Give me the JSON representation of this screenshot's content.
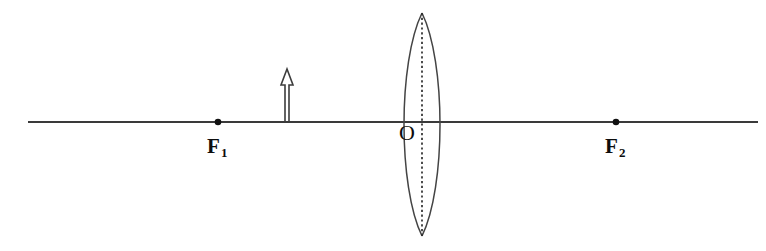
{
  "figure": {
    "background_color": "#ffffff",
    "line_color": "#3a3a3a",
    "label_color": "#0d0d0d",
    "width": 766,
    "height": 251
  },
  "optical_axis": {
    "name": "principal-axis",
    "x_start": 28,
    "x_end": 758,
    "y": 122
  },
  "lens": {
    "type": "biconvex-converging",
    "center_x": 422,
    "top_y": 13,
    "bottom_y": 236,
    "half_width": 24,
    "center_line_style": "dotted"
  },
  "object_arrow": {
    "name": "object",
    "base_x": 287,
    "base_y": 122,
    "tip_y": 69,
    "shaft_half_width": 2,
    "head_half_width": 6,
    "head_height": 16,
    "style": "hollow-outline"
  },
  "points": [
    {
      "id": "f1",
      "label": "F",
      "subscript": "1",
      "x": 218,
      "y": 122,
      "label_x": 212,
      "label_y": 152,
      "radius": 3.3
    },
    {
      "id": "f2",
      "label": "F",
      "subscript": "2",
      "x": 616,
      "y": 122,
      "label_x": 610,
      "label_y": 152,
      "radius": 3.3
    }
  ],
  "center_label": {
    "id": "optical-center",
    "text": "O",
    "x": 399,
    "y": 140
  }
}
